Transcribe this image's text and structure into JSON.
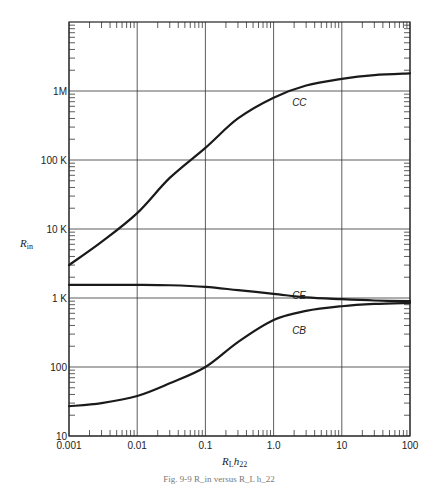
{
  "chart_data": {
    "type": "line",
    "title": "",
    "xlabel": "R_L h_22",
    "ylabel": "R_in",
    "xscale": "log",
    "yscale": "log",
    "xlim": [
      0.0005,
      100
    ],
    "ylim": [
      10,
      10000000
    ],
    "grid": true,
    "x_ticks": [
      {
        "value": 0.001,
        "label": "0.001"
      },
      {
        "value": 0.01,
        "label": "0.01"
      },
      {
        "value": 0.1,
        "label": "0.1"
      },
      {
        "value": 1,
        "label": "1.0"
      },
      {
        "value": 10,
        "label": "10"
      },
      {
        "value": 100,
        "label": "100"
      }
    ],
    "y_ticks": [
      {
        "value": 10,
        "label": "10"
      },
      {
        "value": 100,
        "label": "100"
      },
      {
        "value": 1000,
        "label": "1 K"
      },
      {
        "value": 10000,
        "label": "10 K"
      },
      {
        "value": 100000,
        "label": "100 K"
      },
      {
        "value": 1000000,
        "label": "1M"
      }
    ],
    "x": [
      0.001,
      0.003,
      0.01,
      0.03,
      0.1,
      0.3,
      1,
      3,
      10,
      30,
      100
    ],
    "series": [
      {
        "name": "CC",
        "values": [
          3000,
          6500,
          17000,
          55000,
          150000,
          400000,
          800000,
          1200000,
          1500000,
          1700000,
          1800000
        ]
      },
      {
        "name": "CE",
        "values": [
          1550,
          1550,
          1550,
          1530,
          1450,
          1300,
          1150,
          1020,
          960,
          920,
          900
        ]
      },
      {
        "name": "CB",
        "values": [
          27,
          30,
          38,
          58,
          100,
          230,
          480,
          650,
          760,
          820,
          850
        ]
      }
    ],
    "curve_labels": [
      {
        "text": "CC",
        "x": 2.0,
        "y": 780000
      },
      {
        "text": "CE",
        "x": 2.0,
        "y": 1250
      },
      {
        "text": "CB",
        "x": 2.0,
        "y": 390
      }
    ],
    "caption": "Fig. 9-9   R_in versus R_L h_22"
  },
  "labels": {
    "ylabel_main": "R",
    "ylabel_sub": "in",
    "xlabel_main": "R",
    "xlabel_sub1": "L",
    "xlabel_main2": "h",
    "xlabel_sub2": "22"
  }
}
